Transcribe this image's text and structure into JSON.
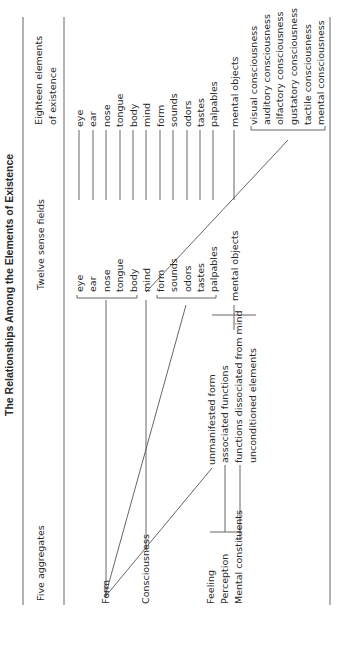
{
  "title": "The Relationships Among the Elements of Existence",
  "headers": {
    "col1": "Five aggregates",
    "col2": "Twelve sense fields",
    "col3_line1": "Eighteen elements",
    "col3_line2": "of existence"
  },
  "aggregates": [
    "Form",
    "Consciousness",
    "Feeling",
    "Perception",
    "Mental constituents"
  ],
  "sense_fields": [
    "eye",
    "ear",
    "nose",
    "tongue",
    "body",
    "mind",
    "form",
    "sounds",
    "odors",
    "tastes",
    "palpables",
    "mental objects"
  ],
  "elements": [
    "eye",
    "ear",
    "nose",
    "tongue",
    "body",
    "mind",
    "form",
    "sounds",
    "odors",
    "tastes",
    "palpables",
    "mental objects"
  ],
  "consciousnesses": [
    "visual consciousness",
    "auditory consciousness",
    "olfactory consciousness",
    "gustatory consciousness",
    "tactile consciousness",
    "mental consciousness"
  ],
  "mental_constituent_subtypes": [
    "unmanifested form",
    "associated functions",
    "functions dissociated from mind",
    "unconditioned elements"
  ]
}
